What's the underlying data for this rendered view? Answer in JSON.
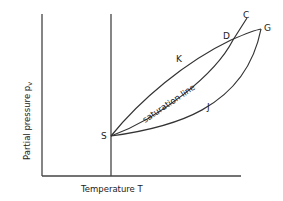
{
  "figure": {
    "type": "phase-diagram",
    "x_axis_label": "Temperature T",
    "y_axis_label": "Partial pressure p",
    "y_axis_subscript": "v",
    "curve_label": "saturation line",
    "points": {
      "S": "S",
      "K": "K",
      "J": "J",
      "D": "D",
      "C": "C",
      "G": "G"
    }
  },
  "colors": {
    "line": "#333333",
    "text": "#222222",
    "background": "#ffffff"
  }
}
